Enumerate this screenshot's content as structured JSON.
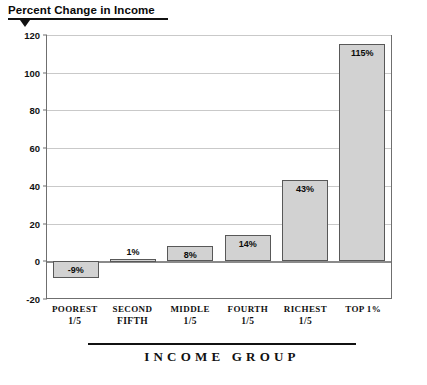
{
  "chart_data": {
    "type": "bar",
    "title": "Percent Change in Income",
    "xlabel": "INCOME GROUP",
    "ylabel": "",
    "categories": [
      "POOREST 1/5",
      "SECOND FIFTH",
      "MIDDLE 1/5",
      "FOURTH 1/5",
      "RICHEST 1/5",
      "TOP 1%"
    ],
    "category_lines": [
      {
        "line1": "POOREST",
        "line2": "1/5"
      },
      {
        "line1": "SECOND",
        "line2": "FIFTH"
      },
      {
        "line1": "MIDDLE",
        "line2": "1/5"
      },
      {
        "line1": "FOURTH",
        "line2": "1/5"
      },
      {
        "line1": "RICHEST",
        "line2": "1/5"
      },
      {
        "line1": "TOP 1%",
        "line2": ""
      }
    ],
    "values": [
      -9,
      1,
      8,
      14,
      43,
      115
    ],
    "data_labels": [
      "-9%",
      "1%",
      "8%",
      "14%",
      "43%",
      "115%"
    ],
    "ylim": [
      -20,
      120
    ],
    "yticks": [
      -20,
      0,
      20,
      40,
      60,
      80,
      100,
      120
    ],
    "ytick_labels": [
      "-20",
      "0",
      "20",
      "40",
      "60",
      "80",
      "100",
      "120"
    ],
    "grid": true,
    "grid_axis": "y",
    "legend": false,
    "bar_fill": "#d2d2d2",
    "bar_edge": "#585858",
    "zero_line_color": "#8a8a8a",
    "gridline_color": "#c9c9c9",
    "frame_color": "#6f6f6f",
    "text_color": "#111111"
  }
}
